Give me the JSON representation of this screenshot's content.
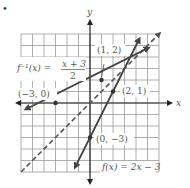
{
  "bullet": "•",
  "axes": {
    "x_label": "x",
    "y_label": "y",
    "x_range": [
      -6,
      6
    ],
    "y_range": [
      -6,
      6
    ]
  },
  "functions": [
    {
      "name": "f",
      "label": "f(x) = 2x − 3",
      "style": "solid",
      "slope": 2,
      "intercept": -3
    },
    {
      "name": "f_inverse",
      "label_lhs": "f⁻¹(x) =",
      "label_num": "x + 3",
      "label_den": "2",
      "style": "solid",
      "slope": 0.5,
      "intercept": 1.5
    },
    {
      "name": "identity",
      "label": "y = x",
      "style": "dashed",
      "slope": 1,
      "intercept": 0
    }
  ],
  "points": [
    {
      "label": "(1, 2)",
      "x": 1,
      "y": 2
    },
    {
      "label": "(2, 1)",
      "x": 2,
      "y": 1
    },
    {
      "label": "(−3, 0)",
      "x": -3,
      "y": 0
    },
    {
      "label": "(0, −3)",
      "x": 0,
      "y": -3
    }
  ],
  "colors": {
    "grid": "#9a9a9a",
    "axis": "#222222",
    "line": "#444444",
    "label": "#555555"
  }
}
